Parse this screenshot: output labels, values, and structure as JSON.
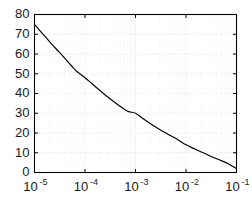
{
  "chart_data": {
    "type": "line",
    "title": "",
    "subtitle": "",
    "xlabel": "",
    "ylabel": "",
    "xscale": "log",
    "yscale": "linear",
    "xlim": [
      1e-05,
      0.1
    ],
    "ylim": [
      0,
      80
    ],
    "grid": true,
    "grid_style": "dotted",
    "grid_color": "#c8c8c8",
    "legend": null,
    "legend_position": "none",
    "annotations": [],
    "xticks": [
      1e-05,
      0.0001,
      0.001,
      0.01,
      0.1
    ],
    "xtick_labels": [
      {
        "base": "10",
        "exponent": "-5"
      },
      {
        "base": "10",
        "exponent": "-4"
      },
      {
        "base": "10",
        "exponent": "-3"
      },
      {
        "base": "10",
        "exponent": "-2"
      },
      {
        "base": "10",
        "exponent": "-1"
      }
    ],
    "yticks": [
      0,
      10,
      20,
      30,
      40,
      50,
      60,
      70,
      80
    ],
    "ytick_labels": [
      "0",
      "10",
      "20",
      "30",
      "40",
      "50",
      "60",
      "70",
      "80"
    ],
    "series": [
      {
        "name": "curve",
        "color": "#000000",
        "linewidth": 1.15,
        "x": [
          1e-05,
          1.3e-05,
          1.7e-05,
          2.2e-05,
          3e-05,
          4e-05,
          5.5e-05,
          7e-05,
          0.0001,
          0.00014,
          0.0002,
          0.0003,
          0.00045,
          0.0007,
          0.001,
          0.0015,
          0.0022,
          0.0035,
          0.005,
          0.007,
          0.01,
          0.015,
          0.022,
          0.035,
          0.05,
          0.07,
          0.1
        ],
        "y": [
          75.0,
          71.6,
          68.3,
          65.0,
          61.3,
          57.8,
          53.8,
          51.0,
          48.0,
          44.8,
          41.4,
          37.7,
          34.3,
          31.0,
          30.0,
          26.8,
          23.9,
          20.8,
          18.6,
          16.5,
          14.0,
          11.9,
          10.0,
          7.6,
          6.0,
          4.3,
          2.0
        ]
      }
    ],
    "key_points": [
      {
        "x": 1e-05,
        "y": 75
      },
      {
        "x": 0.0001,
        "y": 48
      },
      {
        "x": 0.001,
        "y": 30
      },
      {
        "x": 0.01,
        "y": 14
      },
      {
        "x": 0.1,
        "y": 2
      }
    ]
  },
  "figure": {
    "background_color": "#ffffff",
    "axes_color": "#000000"
  }
}
